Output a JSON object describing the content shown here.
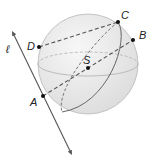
{
  "figure": {
    "type": "sphere-geometry",
    "sphere": {
      "center": "S"
    },
    "line": {
      "name": "ℓ"
    },
    "points": [
      {
        "id": "A",
        "label": "A"
      },
      {
        "id": "B",
        "label": "B"
      },
      {
        "id": "C",
        "label": "C"
      },
      {
        "id": "D",
        "label": "D"
      },
      {
        "id": "S",
        "label": "S"
      }
    ],
    "segments": [
      {
        "from": "D",
        "to": "C",
        "style": "dashed"
      },
      {
        "from": "A",
        "to": "B",
        "style": "dashed",
        "through": "S"
      },
      {
        "from": "A",
        "to": "C",
        "style": "dashed"
      }
    ],
    "colors": {
      "sphere_fill": "#ededed",
      "sphere_edge": "#c4c4c4",
      "lines": "#555555",
      "points": "#111111"
    }
  }
}
